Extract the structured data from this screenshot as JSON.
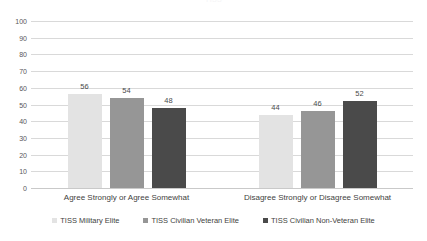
{
  "chart_data": {
    "type": "bar",
    "title": "TISS",
    "categories": [
      "Agree Strongly or Agree Somewhat",
      "Disagree Strongly or Disagree Somewhat"
    ],
    "series": [
      {
        "name": "TISS Military Elite",
        "values": [
          56,
          44
        ],
        "color": "#e3e3e3"
      },
      {
        "name": "TISS Civilian Veteran Elite",
        "values": [
          54,
          46
        ],
        "color": "#969696"
      },
      {
        "name": "TISS Civilian Non-Veteran Elite",
        "values": [
          48,
          52
        ],
        "color": "#4a4a4a"
      }
    ],
    "xlabel": "",
    "ylabel": "",
    "ylim": [
      0,
      100
    ],
    "yticks": [
      100,
      90,
      80,
      70,
      60,
      50,
      40,
      30,
      20,
      10,
      0
    ],
    "grid": true,
    "legend_position": "bottom",
    "data_labels": true
  },
  "colors": {
    "gridline": "#d9d9d9",
    "baseline": "#c9c9c9",
    "tick_text": "#58585a",
    "label_text": "#3f3f41",
    "background": "#ffffff"
  }
}
